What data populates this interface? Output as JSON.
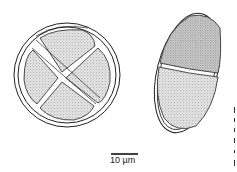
{
  "figure": {
    "subjects": [
      {
        "name": "tetrad-spore",
        "description": "Round spore with four stippled cells divided by a cross wall, surrounded by a double outer wall"
      },
      {
        "name": "two-celled-spore",
        "description": "Oval spore with two stippled cells divided by a transverse septum, surrounded by a double wall"
      }
    ],
    "scale_bar": {
      "label": "10 µm"
    },
    "colors": {
      "ink": "#222222",
      "stipple_fill": "#d9d9d9",
      "background": "#ffffff"
    }
  }
}
